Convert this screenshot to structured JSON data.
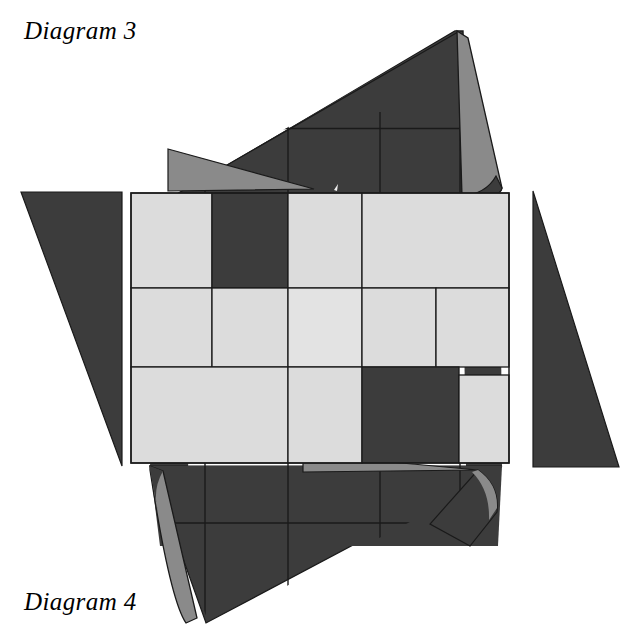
{
  "figure": {
    "title_top": "Diagram 3",
    "title_bottom": "Diagram 4",
    "kind": "folded checkerboard quilt diagram",
    "background_color": "#ffffff",
    "palette": {
      "dark": "#3c3c3c",
      "mid": "#8a8a8a",
      "light": "#dcdcdc",
      "light_alt": "#e3e3e3",
      "outline": "#1a1a1a",
      "paper": "#ffffff"
    },
    "left_triangle": {
      "name": "left-dark-triangle",
      "points": "21,192 122,192 122,466",
      "fill": "#3c3c3c"
    },
    "right_triangle": {
      "name": "right-dark-triangle",
      "points": "533,191 533,467 619,467",
      "fill": "#3c3c3c"
    },
    "top_flap": {
      "name": "top-dark-flap",
      "points": "168,198 458,33 460,196 176,196",
      "fill": "#3c3c3c"
    },
    "top_fold_edge": {
      "name": "top-fold-curl",
      "points": "458,33 468,36 498,190 470,196",
      "fill": "#8a8a8a"
    },
    "top_wedge": {
      "name": "top-grey-wedge",
      "points": "170,148 312,188 170,190",
      "fill": "#8a8a8a"
    },
    "bottom_flap": {
      "name": "bottom-dark-flap",
      "points": "150,466 500,466 205,622",
      "fill": "#3c3c3c"
    },
    "bottom_fold_edge": {
      "name": "bottom-fold-curl",
      "points": "150,466 163,470 196,620 183,622",
      "fill": "#8a8a8a"
    },
    "bottom_wedge": {
      "name": "bottom-grey-wedge",
      "points": "302,455 475,470 302,472",
      "fill": "#8a8a8a"
    },
    "grid": {
      "name": "checkerboard-grid",
      "x_lines": [
        131,
        212,
        288,
        362,
        436,
        509
      ],
      "y_lines": [
        193,
        288,
        367,
        463
      ],
      "rows": 3,
      "cols": 5,
      "cells": [
        [
          "light",
          "dark",
          "light",
          "light",
          "light"
        ],
        [
          "light",
          "light",
          "light_alt",
          "light",
          "light"
        ],
        [
          "light",
          "light",
          "light",
          "dark",
          "light"
        ]
      ]
    },
    "back_blocks": {
      "name": "back-dark-blocks",
      "top_seams_x": [
        205,
        288,
        380,
        460
      ],
      "bottom_seams_x": [
        205,
        288,
        380,
        460
      ],
      "top_band": [
        128,
        460,
        196
      ],
      "bottom_band": [
        463,
        196,
        545
      ]
    }
  }
}
